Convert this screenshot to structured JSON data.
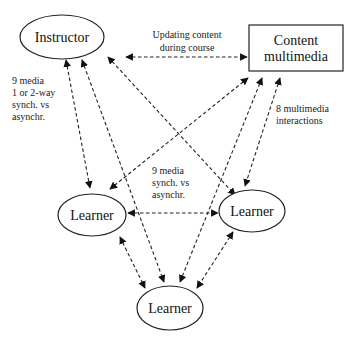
{
  "diagram": {
    "nodes": {
      "instructor": {
        "label": "Instructor",
        "shape": "ellipse"
      },
      "content": {
        "label_line1": "Content",
        "label_line2": "multimedia",
        "shape": "rectangle"
      },
      "learner_left": {
        "label": "Learner",
        "shape": "ellipse"
      },
      "learner_right": {
        "label": "Learner",
        "shape": "ellipse"
      },
      "learner_bottom": {
        "label": "Learner",
        "shape": "ellipse"
      }
    },
    "labels": {
      "updating": {
        "line1": "Updating content",
        "line2": "during course"
      },
      "instructor_learner": {
        "line1": "9 media",
        "line2": "1 or 2-way",
        "line3": "synch. vs",
        "line4": "asynchr."
      },
      "learner_learner": {
        "line1": "9 media",
        "line2": "synch. vs",
        "line3": "asynchr."
      },
      "multimedia": {
        "line1": "8 multimedia",
        "line2": "interactions"
      }
    },
    "edges": [
      {
        "from": "instructor",
        "to": "content",
        "style": "dashed",
        "arrows": "both"
      },
      {
        "from": "instructor",
        "to": "learner_left",
        "style": "dashed",
        "arrows": "both"
      },
      {
        "from": "instructor",
        "to": "learner_bottom",
        "style": "dashed",
        "arrows": "both"
      },
      {
        "from": "instructor",
        "to": "learner_right",
        "style": "dashed",
        "arrows": "both"
      },
      {
        "from": "content",
        "to": "learner_left",
        "style": "dashed",
        "arrows": "both"
      },
      {
        "from": "content",
        "to": "learner_bottom",
        "style": "dashed",
        "arrows": "both"
      },
      {
        "from": "content",
        "to": "learner_right",
        "style": "dashed",
        "arrows": "both"
      },
      {
        "from": "learner_left",
        "to": "learner_right",
        "style": "dashed",
        "arrows": "both"
      },
      {
        "from": "learner_left",
        "to": "learner_bottom",
        "style": "dashed",
        "arrows": "both"
      },
      {
        "from": "learner_right",
        "to": "learner_bottom",
        "style": "dashed",
        "arrows": "both"
      }
    ]
  }
}
